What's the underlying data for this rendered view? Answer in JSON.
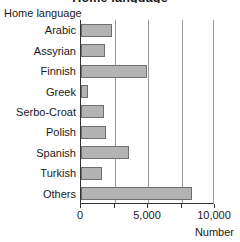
{
  "figure": {
    "clipped_title": "Home language",
    "group_label": "Home language",
    "axis_title": "Number"
  },
  "chart_data": {
    "type": "bar",
    "orientation": "horizontal",
    "title": "Home language",
    "xlabel": "Number",
    "ylabel": "Home language",
    "categories": [
      "Arabic",
      "Assyrian",
      "Finnish",
      "Greek",
      "Serbo-Croat",
      "Polish",
      "Spanish",
      "Turkish",
      "Others"
    ],
    "values": [
      2300,
      1800,
      4950,
      550,
      1750,
      1900,
      3600,
      1600,
      8300
    ],
    "xlim": [
      0,
      10000
    ],
    "xticks": [
      0,
      5000,
      10000
    ],
    "xtick_labels": [
      "0",
      "5,000",
      "10,000"
    ],
    "gridlines": [
      2500,
      5000,
      7500
    ],
    "grid": true,
    "legend": null,
    "bar_color": "#b3b3b3",
    "bar_edge_color": "#6e6e6e",
    "axis_color": "#333333",
    "grid_color": "#9a9a9a"
  }
}
